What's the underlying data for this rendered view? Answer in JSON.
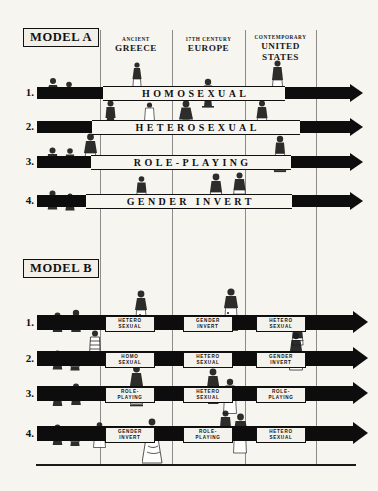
{
  "figure": {
    "background_color": "#f7f5f0",
    "ink_color": "#0d0d0d"
  },
  "eras": [
    {
      "id": "greece",
      "small": "ANCIENT",
      "big": "GREECE"
    },
    {
      "id": "europe",
      "small": "17th CENTURY",
      "big": "EUROPE"
    },
    {
      "id": "usa",
      "small": "CONTEMPORARY",
      "big": "UNITED\nSTATES"
    }
  ],
  "era_labels": {
    "greece_small": "ANCIENT",
    "greece_big": "GREECE",
    "europe_small": "17th CENTURY",
    "europe_big": "EUROPE",
    "usa_small": "CONTEMPORARY",
    "usa_big_line1": "UNITED",
    "usa_big_line2": "STATES"
  },
  "models": {
    "a": {
      "label": "MODEL A",
      "rows": [
        {
          "number": "1.",
          "caption": "HOMOSEXUAL"
        },
        {
          "number": "2.",
          "caption": "HETEROSEXUAL"
        },
        {
          "number": "3.",
          "caption": "ROLE-PLAYING"
        },
        {
          "number": "4.",
          "caption": "GENDER INVERT"
        }
      ]
    },
    "b": {
      "label": "MODEL B",
      "rows": [
        {
          "number": "1.",
          "cells": [
            {
              "era": "greece",
              "caption": "HETERO\nSEXUAL"
            },
            {
              "era": "europe",
              "caption": "GENDER\nINVERT"
            },
            {
              "era": "usa",
              "caption": "HETERO\nSEXUAL"
            }
          ]
        },
        {
          "number": "2.",
          "cells": [
            {
              "era": "greece",
              "caption": "HOMO\nSEXUAL"
            },
            {
              "era": "europe",
              "caption": "HETERO\nSEXUAL"
            },
            {
              "era": "usa",
              "caption": "GENDER\nINVERT"
            }
          ]
        },
        {
          "number": "3.",
          "cells": [
            {
              "era": "greece",
              "caption": "ROLE-\nPLAYING"
            },
            {
              "era": "europe",
              "caption": "HETERO\nSEXUAL"
            },
            {
              "era": "usa",
              "caption": "ROLE-\nPLAYING"
            }
          ]
        },
        {
          "number": "4.",
          "cells": [
            {
              "era": "greece",
              "caption": "GENDER\nINVERT"
            },
            {
              "era": "europe",
              "caption": "ROLE-\nPLAYING"
            },
            {
              "era": "usa",
              "caption": "HETERO\nSEXUAL"
            }
          ]
        }
      ]
    }
  }
}
